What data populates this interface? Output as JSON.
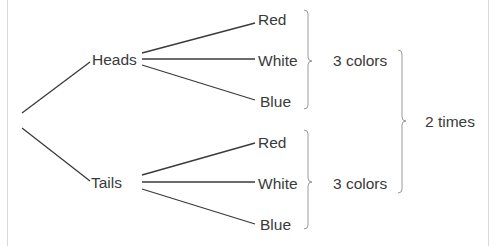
{
  "diagram": {
    "type": "tree",
    "root": "",
    "level1": [
      {
        "label": "Heads",
        "children": [
          "Red",
          "White",
          "Blue"
        ],
        "group_label": "3 colors"
      },
      {
        "label": "Tails",
        "children": [
          "Red",
          "White",
          "Blue"
        ],
        "group_label": "3 colors"
      }
    ],
    "total_label": "2 times",
    "colors": {
      "line": "#3a3a3a",
      "brace": "#9a9a9a",
      "text": "#3a3a3a",
      "border": "#d9d9d9",
      "background": "#ffffff"
    }
  }
}
